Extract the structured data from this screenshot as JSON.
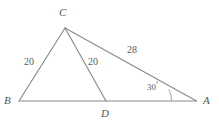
{
  "figure": {
    "stroke_color": "#8a8a8a",
    "label_color": "#555555",
    "background_color": "#ffffff",
    "vertices": [
      {
        "name": "C",
        "label": "C",
        "x": 65,
        "y": 28
      },
      {
        "name": "B",
        "label": "B",
        "x": 19,
        "y": 101
      },
      {
        "name": "D",
        "label": "D",
        "x": 106,
        "y": 101
      },
      {
        "name": "A",
        "label": "A",
        "x": 196,
        "y": 101
      }
    ],
    "segments": [
      {
        "name": "segment-BC",
        "from": "B",
        "to": "C",
        "length_label": "20"
      },
      {
        "name": "segment-CD",
        "from": "C",
        "to": "D",
        "length_label": "20"
      },
      {
        "name": "segment-CA",
        "from": "C",
        "to": "A",
        "length_label": "28"
      },
      {
        "name": "segment-BA",
        "from": "B",
        "to": "A",
        "length_label": ""
      }
    ],
    "measures": {
      "bc": "20",
      "cd": "20",
      "ca": "28"
    },
    "angles": [
      {
        "name": "angle-A",
        "value": "30",
        "unit": "°",
        "at_vertex": "A"
      }
    ],
    "angle_a_text": "30"
  }
}
